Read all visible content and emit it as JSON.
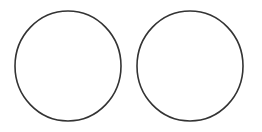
{
  "diagram": {
    "background": "#ffffff",
    "stroke_color": "#333333",
    "stroke_width": 1.6,
    "shapes": [
      {
        "type": "circle",
        "name": "left-circle",
        "cx": 68,
        "cy": 66,
        "rx": 53,
        "ry": 55,
        "fill": "none"
      },
      {
        "type": "circle",
        "name": "right-circle",
        "cx": 190,
        "cy": 66,
        "rx": 53,
        "ry": 55,
        "fill": "none"
      }
    ]
  }
}
